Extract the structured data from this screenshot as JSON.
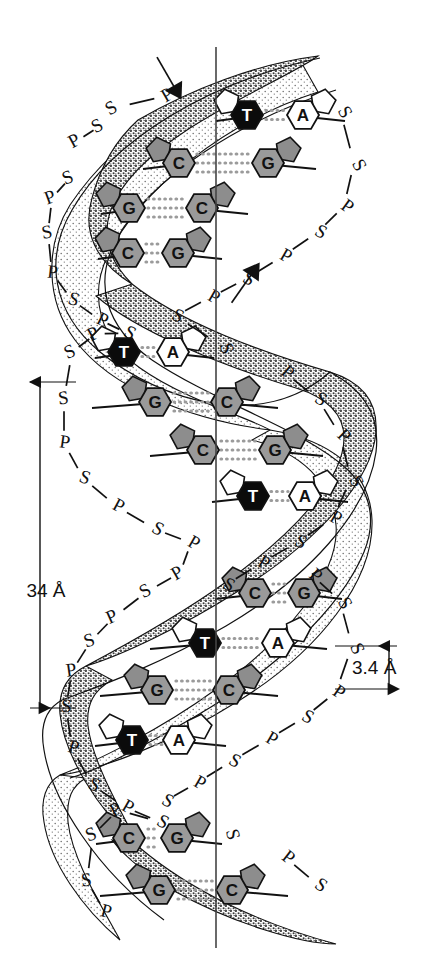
{
  "figure": {
    "background_color": "#ffffff",
    "axis_line_color": "#444444",
    "helix_outline_color": "#111111"
  },
  "colors": {
    "ribbon_light": "#fbfbfb",
    "ribbon_dark_stipple": "#6e6e6e",
    "base_gray": "#9a9a9a",
    "base_black": "#0b0b0b",
    "base_white": "#ffffff",
    "hbond_dots": "#9b9b9b",
    "sugar_gray": "#8d8d8d",
    "sugar_white": "#ffffff"
  },
  "measurements": [
    {
      "id": "pitch",
      "label": "34 Å",
      "value": 34,
      "unit": "Å",
      "meaning": "one full helical turn",
      "x": 40,
      "label_x": 46,
      "label_y": 597,
      "y_top": 382,
      "y_bottom": 708
    },
    {
      "id": "rise",
      "label": "3.4 Å",
      "value": 3.4,
      "unit": "Å",
      "meaning": "rise per base pair",
      "x": 389,
      "label_x": 352,
      "label_y": 674,
      "y_top": 646,
      "y_bottom": 689
    }
  ],
  "axis": {
    "x": 216,
    "y_top": 47,
    "y_bottom": 948
  },
  "direction_arrows": [
    {
      "id": "upper-strand-arrow",
      "direction": "up-right",
      "x": 180,
      "y": 97,
      "angle": 150
    },
    {
      "id": "lower-strand-arrow",
      "direction": "up-left",
      "x": 258,
      "y": 265,
      "angle": 35
    }
  ],
  "base_pairs": [
    {
      "index": 1,
      "y": 115,
      "left": "T",
      "right": "A",
      "left_color": "black",
      "right_color": "white",
      "left_x": 247,
      "right_x": 303,
      "left_sugar_x": 216,
      "right_sugar_x": 345,
      "dots_from": 266,
      "dots_to": 286
    },
    {
      "index": 2,
      "y": 163,
      "left": "C",
      "right": "G",
      "left_color": "gray",
      "right_color": "gray",
      "left_x": 179,
      "right_x": 268,
      "left_sugar_x": 143,
      "right_sugar_x": 316,
      "dots_from": 197,
      "dots_to": 250
    },
    {
      "index": 3,
      "y": 208,
      "left": "G",
      "right": "C",
      "left_color": "gray",
      "right_color": "gray",
      "left_x": 129,
      "right_x": 202,
      "left_sugar_x": 101,
      "right_sugar_x": 248,
      "dots_from": 148,
      "dots_to": 184
    },
    {
      "index": 4,
      "y": 253,
      "left": "C",
      "right": "G",
      "left_color": "gray",
      "right_color": "gray",
      "left_x": 128,
      "right_x": 178,
      "left_sugar_x": 98,
      "right_sugar_x": 222,
      "dots_from": 146,
      "dots_to": 160
    },
    {
      "index": 5,
      "y": 352,
      "left": "T",
      "right": "A",
      "left_color": "black",
      "right_color": "white",
      "left_x": 124,
      "right_x": 173,
      "left_sugar_x": 95,
      "right_sugar_x": 214,
      "dots_from": 142,
      "dots_to": 155
    },
    {
      "index": 6,
      "y": 402,
      "left": "G",
      "right": "C",
      "left_color": "gray",
      "right_color": "gray",
      "left_x": 155,
      "right_x": 227,
      "left_sugar_x": 92,
      "right_sugar_x": 278,
      "dots_from": 174,
      "dots_to": 209
    },
    {
      "index": 7,
      "y": 450,
      "left": "C",
      "right": "G",
      "left_color": "gray",
      "right_color": "gray",
      "left_x": 203,
      "right_x": 275,
      "left_sugar_x": 150,
      "right_sugar_x": 323,
      "dots_from": 221,
      "dots_to": 257
    },
    {
      "index": 8,
      "y": 496,
      "left": "T",
      "right": "A",
      "left_color": "black",
      "right_color": "white",
      "left_x": 253,
      "right_x": 305,
      "left_sugar_x": 212,
      "right_sugar_x": 348,
      "dots_from": 271,
      "dots_to": 288
    },
    {
      "index": 9,
      "y": 593,
      "left": "C",
      "right": "G",
      "left_color": "gray",
      "right_color": "gray",
      "left_x": 255,
      "right_x": 304,
      "left_sugar_x": 215,
      "right_sugar_x": 342,
      "dots_from": 273,
      "dots_to": 287
    },
    {
      "index": 10,
      "y": 643,
      "left": "T",
      "right": "A",
      "left_color": "black",
      "right_color": "white",
      "left_x": 205,
      "right_x": 278,
      "left_sugar_x": 150,
      "right_sugar_x": 327,
      "dots_from": 223,
      "dots_to": 260
    },
    {
      "index": 11,
      "y": 690,
      "left": "G",
      "right": "C",
      "left_color": "gray",
      "right_color": "gray",
      "left_x": 157,
      "right_x": 229,
      "left_sugar_x": 100,
      "right_sugar_x": 278,
      "dots_from": 176,
      "dots_to": 211
    },
    {
      "index": 12,
      "y": 740,
      "left": "T",
      "right": "A",
      "left_color": "black",
      "right_color": "white",
      "left_x": 132,
      "right_x": 179,
      "left_sugar_x": 95,
      "right_sugar_x": 226,
      "dots_from": 150,
      "dots_to": 162
    },
    {
      "index": 13,
      "y": 838,
      "left": "C",
      "right": "G",
      "left_color": "gray",
      "right_color": "gray",
      "left_x": 129,
      "right_x": 177,
      "left_sugar_x": 96,
      "right_sugar_x": 222,
      "dots_from": 148,
      "dots_to": 159
    },
    {
      "index": 14,
      "y": 890,
      "left": "G",
      "right": "C",
      "left_color": "gray",
      "right_color": "gray",
      "left_x": 159,
      "right_x": 232,
      "left_sugar_x": 100,
      "right_sugar_x": 288,
      "dots_from": 178,
      "dots_to": 214
    }
  ],
  "backbone_labels": {
    "description": "Alternating sugar (S) and phosphate (P) units along each ribbon",
    "sugar": "S",
    "phosphate": "P",
    "left_strand": [
      {
        "t": "S",
        "x": 114,
        "y": 113,
        "rot": -30
      },
      {
        "t": "P",
        "x": 170,
        "y": 100,
        "rot": -30
      },
      {
        "t": "P",
        "x": 77,
        "y": 146,
        "rot": -28
      },
      {
        "t": "S",
        "x": 100,
        "y": 131,
        "rot": -28
      },
      {
        "t": "S",
        "x": 70,
        "y": 183,
        "rot": -22
      },
      {
        "t": "P",
        "x": 52,
        "y": 203,
        "rot": -20
      },
      {
        "t": "S",
        "x": 48,
        "y": 238,
        "rot": -10
      },
      {
        "t": "P",
        "x": 52,
        "y": 278,
        "rot": 6
      },
      {
        "t": "S",
        "x": 72,
        "y": 305,
        "rot": 18
      },
      {
        "t": "P",
        "x": 100,
        "y": 325,
        "rot": 26
      },
      {
        "t": "S",
        "x": 127,
        "y": 338,
        "rot": 30
      },
      {
        "t": "P",
        "x": 96,
        "y": 339,
        "rot": -28
      },
      {
        "t": "S",
        "x": 72,
        "y": 357,
        "rot": -24
      },
      {
        "t": "S",
        "x": 64,
        "y": 404,
        "rot": -6
      },
      {
        "t": "P",
        "x": 64,
        "y": 448,
        "rot": 8
      },
      {
        "t": "S",
        "x": 83,
        "y": 483,
        "rot": 20
      },
      {
        "t": "P",
        "x": 116,
        "y": 511,
        "rot": 28
      },
      {
        "t": "S",
        "x": 155,
        "y": 534,
        "rot": 30
      },
      {
        "t": "P",
        "x": 191,
        "y": 548,
        "rot": 30
      },
      {
        "t": "P",
        "x": 180,
        "y": 578,
        "rot": -30
      },
      {
        "t": "S",
        "x": 148,
        "y": 596,
        "rot": -28
      },
      {
        "t": "P",
        "x": 114,
        "y": 622,
        "rot": -24
      },
      {
        "t": "S",
        "x": 91,
        "y": 646,
        "rot": -18
      },
      {
        "t": "P",
        "x": 72,
        "y": 676,
        "rot": -8
      },
      {
        "t": "S",
        "x": 66,
        "y": 712,
        "rot": 4
      },
      {
        "t": "P",
        "x": 72,
        "y": 753,
        "rot": 16
      },
      {
        "t": "S",
        "x": 92,
        "y": 790,
        "rot": 26
      },
      {
        "t": "P",
        "x": 125,
        "y": 812,
        "rot": 30
      },
      {
        "t": "S",
        "x": 160,
        "y": 827,
        "rot": 30
      },
      {
        "t": "P",
        "x": 118,
        "y": 815,
        "rot": -26
      },
      {
        "t": "S",
        "x": 93,
        "y": 840,
        "rot": -20
      },
      {
        "t": "S",
        "x": 87,
        "y": 886,
        "rot": -6
      },
      {
        "t": "P",
        "x": 105,
        "y": 917,
        "rot": 14
      }
    ],
    "right_strand": [
      {
        "t": "S",
        "x": 340,
        "y": 115,
        "rot": 60
      },
      {
        "t": "S",
        "x": 354,
        "y": 168,
        "rot": 62
      },
      {
        "t": "P",
        "x": 344,
        "y": 211,
        "rot": 36
      },
      {
        "t": "S",
        "x": 318,
        "y": 237,
        "rot": 30
      },
      {
        "t": "P",
        "x": 283,
        "y": 261,
        "rot": 30
      },
      {
        "t": "S",
        "x": 246,
        "y": 284,
        "rot": 30
      },
      {
        "t": "P",
        "x": 211,
        "y": 302,
        "rot": 30
      },
      {
        "t": "S",
        "x": 175,
        "y": 321,
        "rot": 30
      },
      {
        "t": "S",
        "x": 221,
        "y": 350,
        "rot": 74
      },
      {
        "t": "P",
        "x": 284,
        "y": 377,
        "rot": 40
      },
      {
        "t": "S",
        "x": 318,
        "y": 404,
        "rot": 32
      },
      {
        "t": "P",
        "x": 340,
        "y": 440,
        "rot": 44
      },
      {
        "t": "S",
        "x": 351,
        "y": 484,
        "rot": 64
      },
      {
        "t": "P",
        "x": 333,
        "y": 523,
        "rot": 30
      },
      {
        "t": "S",
        "x": 298,
        "y": 547,
        "rot": 30
      },
      {
        "t": "P",
        "x": 261,
        "y": 568,
        "rot": 30
      },
      {
        "t": "S",
        "x": 226,
        "y": 590,
        "rot": 30
      },
      {
        "t": "P",
        "x": 312,
        "y": 580,
        "rot": 40
      },
      {
        "t": "S",
        "x": 340,
        "y": 606,
        "rot": 60
      },
      {
        "t": "S",
        "x": 352,
        "y": 651,
        "rot": 66
      },
      {
        "t": "P",
        "x": 336,
        "y": 697,
        "rot": 34
      },
      {
        "t": "S",
        "x": 305,
        "y": 722,
        "rot": 30
      },
      {
        "t": "P",
        "x": 269,
        "y": 744,
        "rot": 30
      },
      {
        "t": "S",
        "x": 232,
        "y": 766,
        "rot": 30
      },
      {
        "t": "P",
        "x": 197,
        "y": 788,
        "rot": 30
      },
      {
        "t": "S",
        "x": 165,
        "y": 806,
        "rot": 30
      },
      {
        "t": "S",
        "x": 227,
        "y": 836,
        "rot": 76
      },
      {
        "t": "P",
        "x": 285,
        "y": 862,
        "rot": 38
      },
      {
        "t": "S",
        "x": 318,
        "y": 890,
        "rot": 34
      }
    ]
  },
  "legend_keys": {
    "S": "sugar (deoxyribose)",
    "P": "phosphate",
    "A": "adenine",
    "T": "thymine",
    "G": "guanine",
    "C": "cytosine"
  }
}
